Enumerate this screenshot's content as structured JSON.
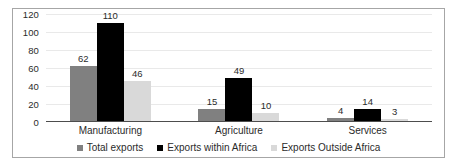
{
  "chart_data": {
    "type": "bar",
    "title": "",
    "xlabel": "",
    "ylabel": "",
    "categories": [
      "Manufacturing",
      "Agriculture",
      "Services"
    ],
    "series": [
      {
        "name": "Total exports",
        "color": "#808080",
        "values": [
          62,
          15,
          4
        ]
      },
      {
        "name": "Exports within Africa",
        "color": "#000000",
        "values": [
          110,
          49,
          14
        ]
      },
      {
        "name": "Exports Outside Africa",
        "color": "#d9d9d9",
        "values": [
          46,
          10,
          3
        ]
      }
    ],
    "ylim": [
      0,
      120
    ],
    "yticks": [
      0,
      20,
      40,
      60,
      80,
      100,
      120
    ],
    "ytick_labels": [
      "0",
      "20",
      "40",
      "60",
      "80",
      "100",
      "120"
    ],
    "data_labels": [
      [
        "62",
        "110",
        "46"
      ],
      [
        "15",
        "49",
        "10"
      ],
      [
        "4",
        "14",
        "3"
      ]
    ],
    "grid": true,
    "grid_color": "#e9e9e9",
    "legend_position": "bottom",
    "border_color": "#a6a6a6",
    "background": "#ffffff",
    "text_color": "#2b2b2b"
  }
}
